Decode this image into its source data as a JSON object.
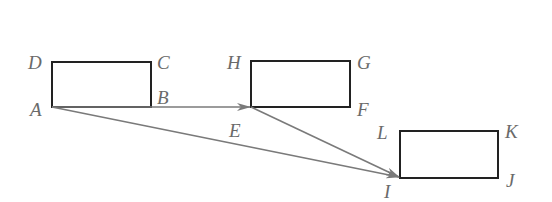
{
  "diagram": {
    "type": "geometry-translation",
    "colors": {
      "rect_stroke": "#222222",
      "arrow_stroke": "#7a7a7a",
      "label": "#6a6a6a"
    },
    "rectangles": [
      {
        "name": "ABCD",
        "vertices": {
          "A": [
            52,
            107
          ],
          "B": [
            151,
            107
          ],
          "C": [
            151,
            62
          ],
          "D": [
            52,
            62
          ]
        }
      },
      {
        "name": "EFGH",
        "vertices": {
          "E": [
            251,
            107
          ],
          "F": [
            350,
            107
          ],
          "G": [
            350,
            61
          ],
          "H": [
            251,
            61
          ]
        }
      },
      {
        "name": "IJKL",
        "vertices": {
          "I": [
            400,
            178
          ],
          "J": [
            498,
            178
          ],
          "K": [
            498,
            131
          ],
          "L": [
            400,
            131
          ]
        }
      }
    ],
    "arrows": [
      {
        "from": "A",
        "to": "E"
      },
      {
        "from": "E",
        "to": "I"
      },
      {
        "from": "A",
        "to": "I"
      }
    ],
    "labels": {
      "A": "A",
      "B": "B",
      "C": "C",
      "D": "D",
      "E": "E",
      "F": "F",
      "G": "G",
      "H": "H",
      "I": "I",
      "J": "J",
      "K": "K",
      "L": "L"
    }
  }
}
